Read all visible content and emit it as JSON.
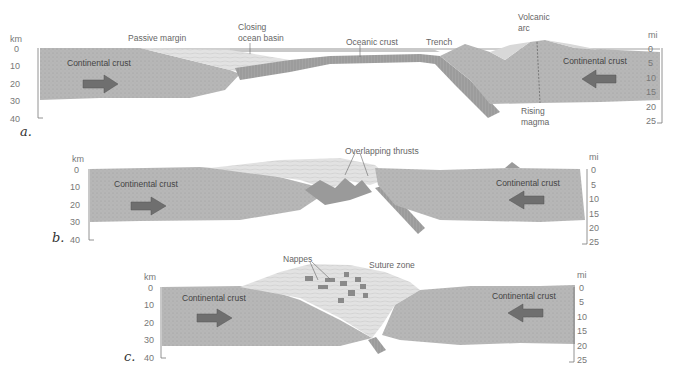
{
  "figure": {
    "colors": {
      "crust": "#b9b9b9",
      "crust_dark": "#a8a8a8",
      "sediment": "#dcdcdc",
      "water": "#c7c7c7",
      "oceanic": "#9d9d9d",
      "arrow": "#6f6f6f",
      "nappe": "#8a8a8a"
    },
    "axes": {
      "left_unit": "km",
      "left_ticks": [
        "0",
        "10",
        "20",
        "30",
        "40"
      ],
      "right_unit": "mi",
      "right_ticks": [
        "0",
        "5",
        "10",
        "15",
        "20",
        "25"
      ]
    },
    "panels": [
      {
        "label": "a.",
        "annotations": [
          "Passive margin",
          "Closing",
          "ocean basin",
          "Oceanic crust",
          "Trench",
          "Volcanic",
          "arc",
          "Rising",
          "magma"
        ],
        "crust_left": "Continental crust",
        "crust_right": "Continental crust"
      },
      {
        "label": "b.",
        "annotations": [
          "Overlapping thrusts"
        ],
        "crust_left": "Continental crust",
        "crust_right": "Continental crust"
      },
      {
        "label": "c.",
        "annotations": [
          "Nappes",
          "Suture zone"
        ],
        "crust_left": "Continental crust",
        "crust_right": "Continental crust"
      }
    ]
  }
}
